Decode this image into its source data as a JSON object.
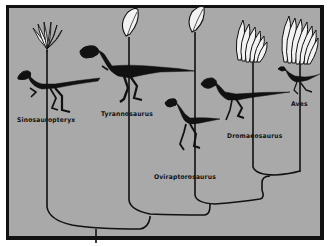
{
  "figure": {
    "type": "cladogram",
    "colors": {
      "background": "#a9a9a9",
      "frame": "#111111",
      "lines": "#111111",
      "feather_fill": "#f2f2f2"
    }
  },
  "taxa": [
    {
      "name": "Sinosauropteryx",
      "feather_type": "downy-filament-tuft"
    },
    {
      "name": "Tyrannosaurus",
      "feather_type": "single-vaned-feather"
    },
    {
      "name": "Oviraptorosaurus",
      "feather_type": "single-vaned-feather"
    },
    {
      "name": "Dromaeosaurus",
      "feather_type": "vaned-feather-cluster"
    },
    {
      "name": "Aves",
      "feather_type": "large-vaned-feather-cluster"
    }
  ],
  "labels": {
    "sinosauropteryx": "Sinosauropteryx",
    "tyrannosaurus": "Tyrannosaurus",
    "oviraptorosaurus": "Oviraptorosaurus",
    "dromaeosaurus": "Dromaeosaurus",
    "aves": "Aves"
  }
}
